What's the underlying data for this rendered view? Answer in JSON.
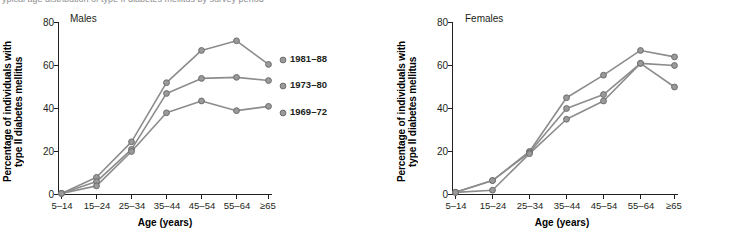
{
  "caption": {
    "text": "ypical age distribution of type II diabetes mellitus by survey period"
  },
  "axes": {
    "ylabel_line1": "Percentage of individuals with",
    "ylabel_line2": "type II diabetes mellitus",
    "xlabel": "Age (years)",
    "yticks": [
      "0",
      "20",
      "40",
      "60",
      "80"
    ],
    "xticks": [
      "5–14",
      "15–24",
      "25–34",
      "35–44",
      "45–54",
      "55–64",
      "≥65"
    ]
  },
  "legend": {
    "items": [
      {
        "label": "1981–88"
      },
      {
        "label": "1973–80"
      },
      {
        "label": "1969–72"
      }
    ]
  },
  "colors": {
    "line": "#8c8c8c",
    "marker_fill": "#9a9a9a",
    "marker_stroke": "#6d6d6d",
    "axis": "#231f20",
    "text": "#231f20",
    "background": "#ffffff"
  },
  "panels": [
    {
      "title": "Males"
    },
    {
      "title": "Females"
    }
  ],
  "chart_data": [
    {
      "type": "line",
      "title": "Males",
      "xlabel": "Age (years)",
      "ylabel": "Percentage of individuals with type II diabetes mellitus",
      "categories": [
        "5–14",
        "15–24",
        "25–34",
        "35–44",
        "45–54",
        "55–64",
        "≥65"
      ],
      "ylim": [
        0,
        80
      ],
      "yticks": [
        0,
        20,
        40,
        60,
        80
      ],
      "grid": false,
      "legend_position": "right",
      "series": [
        {
          "name": "1981–88",
          "values": [
            0.5,
            8,
            24.5,
            52,
            67,
            71.5,
            60.5
          ]
        },
        {
          "name": "1973–80",
          "values": [
            0.5,
            6,
            21,
            47,
            54,
            54.5,
            53
          ]
        },
        {
          "name": "1969–72",
          "values": [
            0.5,
            4,
            20,
            38,
            43.5,
            39,
            41
          ]
        }
      ]
    },
    {
      "type": "line",
      "title": "Females",
      "xlabel": "Age (years)",
      "ylabel": "Percentage of individuals with type II diabetes mellitus",
      "categories": [
        "5–14",
        "15–24",
        "25–34",
        "35–44",
        "45–54",
        "55–64",
        "≥65"
      ],
      "ylim": [
        0,
        80
      ],
      "yticks": [
        0,
        20,
        40,
        60,
        80
      ],
      "grid": false,
      "legend_position": "none",
      "series": [
        {
          "name": "1981–88",
          "values": [
            1,
            6.5,
            20,
            45,
            55.5,
            67,
            64
          ]
        },
        {
          "name": "1973–80",
          "values": [
            1,
            6.5,
            19.5,
            40,
            46.5,
            61,
            60
          ]
        },
        {
          "name": "1969–72",
          "values": [
            1,
            2,
            19,
            35,
            43.5,
            61,
            50
          ]
        }
      ]
    }
  ]
}
